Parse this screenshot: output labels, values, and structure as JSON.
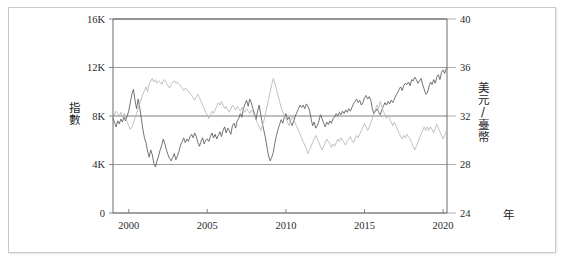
{
  "chart_data": {
    "type": "line",
    "title": "",
    "subtitle": "",
    "xlabel": "年",
    "grid": true,
    "legend_position": "none",
    "xlim": [
      1999,
      2020.25
    ],
    "x_ticks": [
      "2000",
      "2005",
      "2010",
      "2015",
      "2020"
    ],
    "x_tick_values": [
      2000,
      2005,
      2010,
      2015,
      2020
    ],
    "axes": [
      {
        "id": "left",
        "label": "指數",
        "label_chars": [
          "指",
          "數"
        ],
        "ylim": [
          0,
          16000
        ],
        "ticks": [
          "0",
          "4K",
          "8K",
          "12K",
          "16K"
        ],
        "tick_values": [
          0,
          4000,
          8000,
          12000,
          16000
        ],
        "color": "#5a5a5a"
      },
      {
        "id": "right",
        "label": "美元/臺幣",
        "label_chars": [
          "美",
          "元",
          "/",
          "臺",
          "幣"
        ],
        "ylim": [
          24,
          40
        ],
        "ticks": [
          "24",
          "28",
          "32",
          "36",
          "40"
        ],
        "tick_values": [
          24,
          28,
          32,
          36,
          40
        ],
        "color": "#b6b6b6"
      }
    ],
    "series": [
      {
        "name": "指數",
        "axis": "left",
        "color": "#5a5a5a",
        "x": [
          1999.0,
          1999.1,
          1999.2,
          1999.3,
          1999.4,
          1999.5,
          1999.6,
          1999.7,
          1999.8,
          1999.9,
          2000.0,
          2000.1,
          2000.2,
          2000.3,
          2000.4,
          2000.5,
          2000.6,
          2000.7,
          2000.8,
          2000.9,
          2001.0,
          2001.1,
          2001.2,
          2001.3,
          2001.4,
          2001.5,
          2001.6,
          2001.7,
          2001.8,
          2001.9,
          2002.0,
          2002.1,
          2002.2,
          2002.3,
          2002.4,
          2002.5,
          2002.6,
          2002.7,
          2002.8,
          2002.9,
          2003.0,
          2003.1,
          2003.2,
          2003.3,
          2003.4,
          2003.5,
          2003.6,
          2003.7,
          2003.8,
          2003.9,
          2004.0,
          2004.1,
          2004.2,
          2004.3,
          2004.4,
          2004.5,
          2004.6,
          2004.7,
          2004.8,
          2004.9,
          2005.0,
          2005.1,
          2005.2,
          2005.3,
          2005.4,
          2005.5,
          2005.6,
          2005.7,
          2005.8,
          2005.9,
          2006.0,
          2006.1,
          2006.2,
          2006.3,
          2006.4,
          2006.5,
          2006.6,
          2006.7,
          2006.8,
          2006.9,
          2007.0,
          2007.1,
          2007.2,
          2007.3,
          2007.4,
          2007.5,
          2007.6,
          2007.7,
          2007.8,
          2007.9,
          2008.0,
          2008.1,
          2008.2,
          2008.3,
          2008.4,
          2008.5,
          2008.6,
          2008.7,
          2008.8,
          2008.9,
          2009.0,
          2009.1,
          2009.2,
          2009.3,
          2009.4,
          2009.5,
          2009.6,
          2009.7,
          2009.8,
          2009.9,
          2010.0,
          2010.1,
          2010.2,
          2010.3,
          2010.4,
          2010.5,
          2010.6,
          2010.7,
          2010.8,
          2010.9,
          2011.0,
          2011.1,
          2011.2,
          2011.3,
          2011.4,
          2011.5,
          2011.6,
          2011.7,
          2011.8,
          2011.9,
          2012.0,
          2012.1,
          2012.2,
          2012.3,
          2012.4,
          2012.5,
          2012.6,
          2012.7,
          2012.8,
          2012.9,
          2013.0,
          2013.1,
          2013.2,
          2013.3,
          2013.4,
          2013.5,
          2013.6,
          2013.7,
          2013.8,
          2013.9,
          2014.0,
          2014.1,
          2014.2,
          2014.3,
          2014.4,
          2014.5,
          2014.6,
          2014.7,
          2014.8,
          2014.9,
          2015.0,
          2015.1,
          2015.2,
          2015.3,
          2015.4,
          2015.5,
          2015.6,
          2015.7,
          2015.8,
          2015.9,
          2016.0,
          2016.1,
          2016.2,
          2016.3,
          2016.4,
          2016.5,
          2016.6,
          2016.7,
          2016.8,
          2016.9,
          2017.0,
          2017.1,
          2017.2,
          2017.3,
          2017.4,
          2017.5,
          2017.6,
          2017.7,
          2017.8,
          2017.9,
          2018.0,
          2018.1,
          2018.2,
          2018.3,
          2018.4,
          2018.5,
          2018.6,
          2018.7,
          2018.8,
          2018.9,
          2019.0,
          2019.1,
          2019.2,
          2019.3,
          2019.4,
          2019.5,
          2019.6,
          2019.7,
          2019.8,
          2019.9,
          2020.0,
          2020.1,
          2020.2
        ],
        "y": [
          7800,
          7450,
          7100,
          7600,
          7350,
          7750,
          7500,
          7900,
          7600,
          8000,
          8400,
          9100,
          9800,
          10200,
          9300,
          8600,
          9400,
          8700,
          7800,
          6900,
          6200,
          5800,
          5100,
          4600,
          5200,
          4800,
          4100,
          3800,
          4300,
          4700,
          5200,
          5600,
          6100,
          5700,
          5200,
          4800,
          4500,
          4300,
          4600,
          4900,
          4400,
          4700,
          5100,
          5600,
          5900,
          6200,
          5800,
          6100,
          5900,
          6300,
          6500,
          6200,
          6600,
          6300,
          5800,
          5500,
          5900,
          6200,
          5700,
          6000,
          6100,
          5900,
          6300,
          6600,
          6200,
          6500,
          6100,
          6400,
          6700,
          6300,
          6800,
          7100,
          6600,
          7000,
          6800,
          6500,
          7200,
          7400,
          7000,
          7600,
          7800,
          8200,
          7900,
          8600,
          9000,
          9300,
          8800,
          9400,
          9100,
          8600,
          8200,
          7700,
          8400,
          8900,
          8100,
          7400,
          6800,
          6200,
          5400,
          4700,
          4300,
          4600,
          5000,
          5800,
          6400,
          6900,
          7300,
          7700,
          7400,
          7900,
          8200,
          7700,
          7900,
          7500,
          7200,
          7600,
          8000,
          8300,
          8600,
          8900,
          8700,
          8900,
          8600,
          9000,
          8800,
          8500,
          7800,
          7200,
          7500,
          7000,
          7200,
          7600,
          8100,
          7800,
          7400,
          7100,
          7500,
          7300,
          7600,
          7400,
          7800,
          7900,
          8200,
          8000,
          8300,
          8100,
          8400,
          8200,
          8500,
          8300,
          8600,
          8400,
          8700,
          9000,
          9200,
          9400,
          9100,
          9300,
          8900,
          9100,
          9500,
          9700,
          9400,
          9600,
          9300,
          8600,
          8200,
          8400,
          8600,
          8300,
          8100,
          8500,
          8800,
          9100,
          8900,
          9200,
          9000,
          9300,
          9100,
          9400,
          9700,
          9900,
          10200,
          10400,
          10100,
          10500,
          10700,
          10600,
          10800,
          10500,
          11000,
          10900,
          11200,
          11000,
          10700,
          10900,
          11100,
          10600,
          10200,
          9800,
          9900,
          10400,
          10800,
          10600,
          11000,
          10700,
          11200,
          11400,
          11000,
          11600,
          11800,
          11500,
          11900
        ]
      },
      {
        "name": "美元/臺幣",
        "axis": "right",
        "color": "#b6b6b6",
        "x": [
          1999.0,
          1999.1,
          1999.2,
          1999.3,
          1999.4,
          1999.5,
          1999.6,
          1999.7,
          1999.8,
          1999.9,
          2000.0,
          2000.1,
          2000.2,
          2000.3,
          2000.4,
          2000.5,
          2000.6,
          2000.7,
          2000.8,
          2000.9,
          2001.0,
          2001.1,
          2001.2,
          2001.3,
          2001.4,
          2001.5,
          2001.6,
          2001.7,
          2001.8,
          2001.9,
          2002.0,
          2002.1,
          2002.2,
          2002.3,
          2002.4,
          2002.5,
          2002.6,
          2002.7,
          2002.8,
          2002.9,
          2003.0,
          2003.1,
          2003.2,
          2003.3,
          2003.4,
          2003.5,
          2003.6,
          2003.7,
          2003.8,
          2003.9,
          2004.0,
          2004.1,
          2004.2,
          2004.3,
          2004.4,
          2004.5,
          2004.6,
          2004.7,
          2004.8,
          2004.9,
          2005.0,
          2005.1,
          2005.2,
          2005.3,
          2005.4,
          2005.5,
          2005.6,
          2005.7,
          2005.8,
          2005.9,
          2006.0,
          2006.1,
          2006.2,
          2006.3,
          2006.4,
          2006.5,
          2006.6,
          2006.7,
          2006.8,
          2006.9,
          2007.0,
          2007.1,
          2007.2,
          2007.3,
          2007.4,
          2007.5,
          2007.6,
          2007.7,
          2007.8,
          2007.9,
          2008.0,
          2008.1,
          2008.2,
          2008.3,
          2008.4,
          2008.5,
          2008.6,
          2008.7,
          2008.8,
          2008.9,
          2009.0,
          2009.1,
          2009.2,
          2009.3,
          2009.4,
          2009.5,
          2009.6,
          2009.7,
          2009.8,
          2009.9,
          2010.0,
          2010.1,
          2010.2,
          2010.3,
          2010.4,
          2010.5,
          2010.6,
          2010.7,
          2010.8,
          2010.9,
          2011.0,
          2011.1,
          2011.2,
          2011.3,
          2011.4,
          2011.5,
          2011.6,
          2011.7,
          2011.8,
          2011.9,
          2012.0,
          2012.1,
          2012.2,
          2012.3,
          2012.4,
          2012.5,
          2012.6,
          2012.7,
          2012.8,
          2012.9,
          2013.0,
          2013.1,
          2013.2,
          2013.3,
          2013.4,
          2013.5,
          2013.6,
          2013.7,
          2013.8,
          2013.9,
          2014.0,
          2014.1,
          2014.2,
          2014.3,
          2014.4,
          2014.5,
          2014.6,
          2014.7,
          2014.8,
          2014.9,
          2015.0,
          2015.1,
          2015.2,
          2015.3,
          2015.4,
          2015.5,
          2015.6,
          2015.7,
          2015.8,
          2015.9,
          2016.0,
          2016.1,
          2016.2,
          2016.3,
          2016.4,
          2016.5,
          2016.6,
          2016.7,
          2016.8,
          2016.9,
          2017.0,
          2017.1,
          2017.2,
          2017.3,
          2017.4,
          2017.5,
          2017.6,
          2017.7,
          2017.8,
          2017.9,
          2018.0,
          2018.1,
          2018.2,
          2018.3,
          2018.4,
          2018.5,
          2018.6,
          2018.7,
          2018.8,
          2018.9,
          2019.0,
          2019.1,
          2019.2,
          2019.3,
          2019.4,
          2019.5,
          2019.6,
          2019.7,
          2019.8,
          2019.9,
          2020.0,
          2020.1,
          2020.2
        ],
        "y": [
          32.3,
          32.1,
          32.4,
          32.2,
          32.0,
          32.3,
          31.9,
          32.2,
          31.8,
          31.5,
          31.2,
          30.9,
          31.1,
          31.4,
          31.8,
          32.2,
          32.6,
          33.0,
          33.4,
          33.8,
          34.1,
          34.4,
          34.0,
          34.6,
          34.9,
          35.1,
          34.8,
          35.0,
          34.7,
          34.9,
          34.8,
          34.6,
          34.9,
          35.0,
          34.7,
          34.5,
          34.3,
          34.6,
          34.8,
          34.9,
          34.7,
          34.8,
          34.6,
          34.5,
          34.3,
          34.1,
          34.3,
          34.2,
          34.0,
          33.9,
          33.7,
          33.5,
          33.3,
          33.6,
          33.8,
          33.5,
          33.2,
          32.9,
          32.6,
          32.3,
          32.1,
          31.8,
          32.1,
          32.4,
          32.2,
          32.5,
          32.8,
          33.1,
          32.9,
          33.2,
          32.9,
          32.6,
          32.8,
          32.5,
          32.3,
          32.6,
          32.9,
          32.7,
          32.5,
          32.8,
          32.6,
          32.4,
          32.7,
          32.5,
          32.3,
          32.6,
          32.4,
          32.2,
          32.5,
          32.3,
          32.0,
          31.7,
          31.4,
          31.1,
          30.8,
          31.2,
          31.6,
          32.2,
          32.8,
          33.4,
          34.0,
          34.6,
          35.1,
          34.7,
          34.2,
          33.7,
          33.2,
          32.7,
          32.3,
          32.0,
          31.8,
          31.5,
          31.2,
          31.6,
          32.0,
          31.7,
          31.4,
          31.1,
          30.8,
          30.5,
          30.2,
          29.9,
          29.6,
          29.3,
          28.9,
          29.2,
          29.5,
          29.8,
          30.1,
          30.4,
          30.1,
          29.8,
          29.5,
          29.2,
          29.5,
          29.8,
          30.1,
          29.9,
          29.7,
          29.4,
          29.7,
          29.5,
          29.8,
          30.1,
          29.9,
          30.2,
          30.0,
          29.8,
          29.6,
          29.9,
          30.1,
          30.3,
          30.0,
          29.8,
          30.1,
          30.4,
          30.2,
          30.5,
          30.8,
          31.1,
          31.4,
          31.1,
          30.8,
          31.1,
          31.4,
          31.8,
          32.2,
          32.6,
          32.9,
          32.6,
          33.2,
          32.8,
          32.4,
          32.1,
          31.8,
          32.1,
          31.8,
          31.5,
          31.2,
          31.5,
          31.2,
          30.9,
          30.6,
          30.3,
          30.1,
          30.4,
          30.2,
          30.5,
          30.3,
          30.1,
          29.8,
          29.5,
          29.2,
          29.5,
          29.8,
          30.2,
          30.5,
          30.8,
          31.1,
          30.8,
          31.1,
          30.8,
          31.1,
          30.9,
          30.6,
          31.0,
          31.3,
          31.0,
          30.7,
          30.4,
          30.1,
          30.4,
          30.7
        ]
      }
    ]
  }
}
